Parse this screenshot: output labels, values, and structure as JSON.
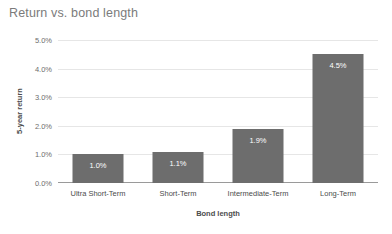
{
  "chart_data": {
    "type": "bar",
    "title": "Return vs. bond length",
    "xlabel": "Bond length",
    "ylabel": "5-year return",
    "categories": [
      "Ultra Short-Term",
      "Short-Term",
      "Intermediate-Term",
      "Long-Term"
    ],
    "values": [
      1.0,
      1.1,
      1.9,
      4.5
    ],
    "value_labels": [
      "1.0%",
      "1.1%",
      "1.9%",
      "4.5%"
    ],
    "ylim": [
      0,
      5
    ],
    "ytick_values": [
      0.0,
      1.0,
      2.0,
      3.0,
      4.0,
      5.0
    ],
    "ytick_labels": [
      "0.0%",
      "1.0%",
      "2.0%",
      "3.0%",
      "4.0%",
      "5.0%"
    ],
    "grid": true,
    "legend": false,
    "legend_position": "none",
    "series": [
      {
        "name": "5-year return",
        "values": [
          1.0,
          1.1,
          1.9,
          4.5
        ],
        "color": "#6d6d6d"
      }
    ],
    "colors": {
      "bar": "#6d6d6d",
      "gridline": "#e6e6e6",
      "axis": "#9a9a9a",
      "title_text": "#7b7b7b",
      "tick_text": "#6d6d6d",
      "axis_title_text": "#4c4c4c",
      "value_label_text": "#ffffff",
      "background": "#ffffff"
    }
  }
}
